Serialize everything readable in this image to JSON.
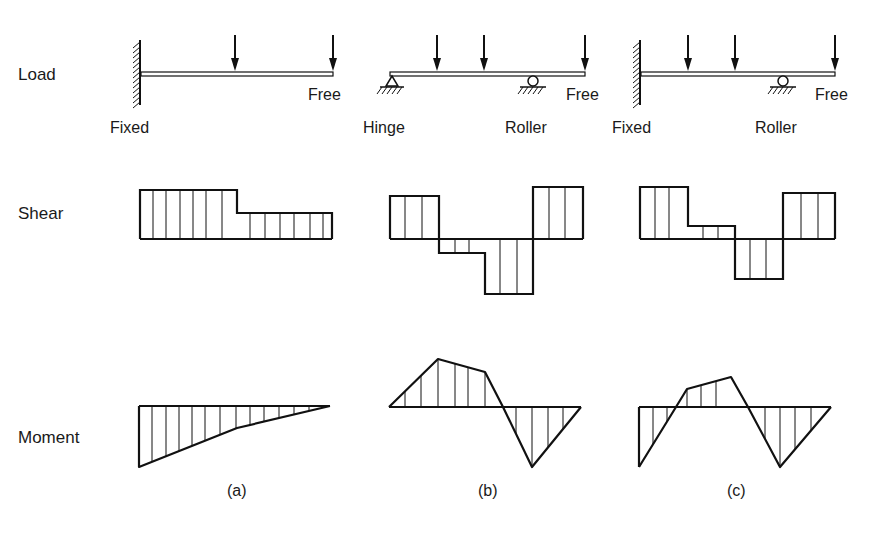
{
  "row_labels": {
    "load": "Load",
    "shear": "Shear",
    "moment": "Moment"
  },
  "colors": {
    "ink": "#111111",
    "background": "#ffffff"
  },
  "panels": [
    {
      "caption": "(a)",
      "support_labels": {
        "left": "Fixed",
        "right_end": "Free"
      },
      "beam": {
        "x1": 141,
        "x2": 333,
        "y": 74
      },
      "supports": [
        {
          "type": "fixed-wall",
          "x": 140
        }
      ],
      "loads_x": [
        235,
        333
      ],
      "shear": {
        "baseline": 239,
        "segments": [
          {
            "x1": 140,
            "x2": 237,
            "v": 190
          },
          {
            "x1": 237,
            "x2": 332,
            "v": 213
          }
        ],
        "hatch_x": [
          153,
          166,
          180,
          193,
          206,
          222,
          250,
          265,
          280,
          294,
          310,
          323
        ]
      },
      "moment": {
        "baseline": 406,
        "x1": 139,
        "x2": 330,
        "points": [
          [
            139,
            406
          ],
          [
            139,
            467
          ],
          [
            237,
            428
          ],
          [
            330,
            406
          ]
        ],
        "hatch_x": [
          152,
          166,
          179,
          192,
          205,
          220,
          236,
          250,
          264,
          279,
          294,
          309
        ]
      }
    },
    {
      "caption": "(b)",
      "support_labels": {
        "left": "Hinge",
        "middle": "Roller",
        "right_end": "Free"
      },
      "beam": {
        "x1": 390,
        "x2": 585,
        "y": 74
      },
      "supports": [
        {
          "type": "hinge",
          "x": 392
        },
        {
          "type": "roller",
          "x": 533
        }
      ],
      "loads_x": [
        437,
        484,
        585
      ],
      "shear": {
        "baseline": 239,
        "segments": [
          {
            "x1": 390,
            "x2": 439,
            "v": 196
          },
          {
            "x1": 439,
            "x2": 485,
            "v": 253
          },
          {
            "x1": 485,
            "x2": 533,
            "v": 294
          },
          {
            "x1": 533,
            "x2": 583,
            "v": 187
          }
        ],
        "hatch_x": [
          405,
          422,
          455,
          469,
          500,
          517,
          549,
          565
        ]
      },
      "moment": {
        "baseline": 407,
        "x1": 389,
        "x2": 581,
        "points": [
          [
            389,
            407
          ],
          [
            438,
            359
          ],
          [
            485,
            372
          ],
          [
            503,
            407
          ],
          [
            532,
            467
          ],
          [
            581,
            407
          ]
        ],
        "hatch_x": [
          405,
          421,
          438,
          455,
          468,
          485,
          516,
          532,
          548,
          563
        ]
      }
    },
    {
      "caption": "(c)",
      "support_labels": {
        "left": "Fixed",
        "middle": "Roller",
        "right_end": "Free"
      },
      "beam": {
        "x1": 641,
        "x2": 835,
        "y": 74
      },
      "supports": [
        {
          "type": "fixed-wall",
          "x": 640
        },
        {
          "type": "roller",
          "x": 783
        }
      ],
      "loads_x": [
        688,
        735,
        835
      ],
      "shear": {
        "baseline": 239,
        "segments": [
          {
            "x1": 640,
            "x2": 688,
            "v": 187
          },
          {
            "x1": 688,
            "x2": 735,
            "v": 226
          },
          {
            "x1": 735,
            "x2": 783,
            "v": 279
          },
          {
            "x1": 783,
            "x2": 835,
            "v": 193
          }
        ],
        "hatch_x": [
          655,
          669,
          703,
          718,
          750,
          766,
          801,
          818
        ]
      },
      "moment": {
        "baseline": 407,
        "x1": 639,
        "x2": 831,
        "points": [
          [
            639,
            467
          ],
          [
            676,
            407
          ],
          [
            687,
            389
          ],
          [
            731,
            377
          ],
          [
            748,
            407
          ],
          [
            780,
            467
          ],
          [
            831,
            407
          ]
        ],
        "hatch_x": [
          653,
          667,
          687,
          701,
          716,
          765,
          780,
          795,
          811
        ]
      }
    }
  ],
  "label_positions": {
    "row_x": 18,
    "load_y": 80,
    "shear_y": 219,
    "moment_y": 443,
    "caption_y": 496
  }
}
